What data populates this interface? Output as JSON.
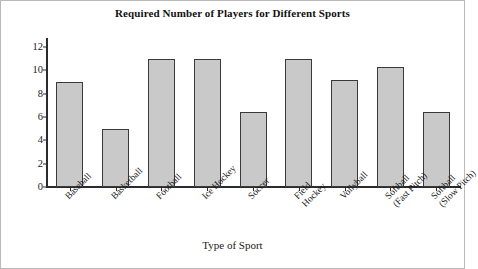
{
  "chart_data": {
    "type": "bar",
    "title": "Required Number of Players for Different Sports",
    "xlabel": "Type of Sport",
    "ylabel": "Number of Players Required",
    "categories": [
      "Baseball",
      "Basketball",
      "Football",
      "Ice Hockey",
      "Soccer",
      "Field Hockey",
      "Vollyball",
      "Softball (Fast Pitch)",
      "Softball (Slow Pitch)"
    ],
    "category_lines": [
      [
        "Baseball"
      ],
      [
        "Basketball"
      ],
      [
        "Football"
      ],
      [
        "Ice Hockey"
      ],
      [
        "Soccer"
      ],
      [
        "Field",
        "Hockey"
      ],
      [
        "Vollyball"
      ],
      [
        "Softball",
        "(Fast Pitch)"
      ],
      [
        "Softball",
        "(Slow Pitch)"
      ]
    ],
    "values": [
      9,
      5,
      11,
      11,
      6.4,
      11,
      9.2,
      10.3,
      6.4
    ],
    "ylim": [
      0,
      12.7
    ],
    "yticks": [
      0,
      2,
      4,
      6,
      8,
      10,
      12
    ],
    "ytick_labels": [
      "0",
      "2",
      "4",
      "6",
      "8",
      "10",
      "12"
    ],
    "grid": false,
    "legend": false,
    "bar_color": "#c9c9c9",
    "bar_border_color": "#3a3a3a",
    "axis_color": "#2b2b2b"
  }
}
